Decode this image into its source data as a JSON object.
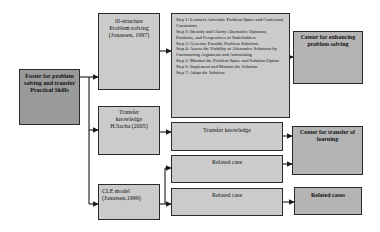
{
  "root": {
    "label": "Foster for problem solving and transfer Practical Skills"
  },
  "branches": [
    {
      "label_lines": [
        "ill-structure",
        "Problem solving",
        "(Jonassen, 1997)"
      ]
    },
    {
      "label_lines": [
        "Transfer",
        "knowledge",
        "H.Sacha (2005)"
      ]
    },
    {
      "label_lines": [
        "CLE model",
        "(Jonassen,1999)"
      ]
    }
  ],
  "steps": [
    "Step 1: Learners Articulate Problem Space and Contextual Constraints",
    "Step 2: Identify and Clarify Alternative Opinions, Positions, and Perspectives of Stakeholders",
    "Step 3: Generate Possible Problem Solutions",
    "Step 4: Assess the Viability of Alternative Solutions by Constructing Arguments and Articulating",
    "Step 5: Monitor the Problem Space and Solution Option",
    "Step 6: Implement and Monitor the Solution",
    "Step 7: Adapt the Solution"
  ],
  "middle": {
    "transfer_knowledge": "Transfer knowledge",
    "related_case_1": "Related case",
    "related_case_2": "Related case"
  },
  "outcomes": {
    "enhancing": "Center for enhancing problem solving",
    "transfer": "Center for transfer of learning",
    "related_cases": "Related cases"
  },
  "colors": {
    "root_fill": "#9a9a9a",
    "box_fill": "#cbcbcb",
    "outcome_fill": "#b4b4b4",
    "stroke": "#2a2a2a"
  }
}
